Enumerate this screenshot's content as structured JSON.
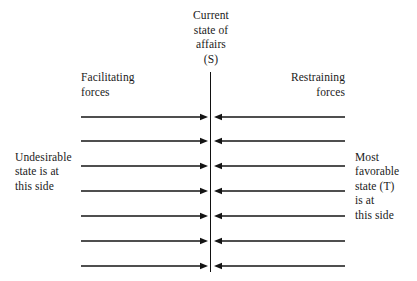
{
  "figure": {
    "type": "force-field-diagram",
    "caption_remnant": "",
    "center_header": {
      "lines": [
        "Current",
        "state of",
        "affairs",
        "(S)"
      ]
    },
    "left_column_header": {
      "lines": [
        "Facilitating",
        "forces"
      ]
    },
    "right_column_header": {
      "lines": [
        "Restraining",
        "forces"
      ]
    },
    "left_note": {
      "lines": [
        "Undesirable",
        "state is at",
        "this side"
      ]
    },
    "right_note": {
      "lines": [
        "Most",
        "favorable",
        "state (T)",
        "is at",
        "this side"
      ]
    }
  },
  "chart_data": {
    "type": "diagram",
    "axis": {
      "orientation": "vertical",
      "x": 211,
      "y_start": 72,
      "y_end": 272,
      "label": "Current state of affairs (S)"
    },
    "arrow_rows_y": [
      117,
      141,
      166,
      191,
      216,
      241,
      266
    ],
    "arrow_count_per_side": 7,
    "left_arrows": {
      "label": "Facilitating forces",
      "direction": "rightward",
      "x_start": 81,
      "x_end": 208,
      "color": "#141414"
    },
    "right_arrows": {
      "label": "Restraining forces",
      "direction": "leftward",
      "x_start": 345,
      "x_end": 214,
      "color": "#141414"
    },
    "annotations": [
      {
        "side": "left",
        "text": "Undesirable state is at this side"
      },
      {
        "side": "right",
        "text": "Most favorable state (T) is at this side"
      }
    ],
    "grid": false,
    "legend": "none"
  },
  "colors": {
    "ink": "#141414",
    "background": "#ffffff",
    "faded": "#b9b9b9"
  }
}
